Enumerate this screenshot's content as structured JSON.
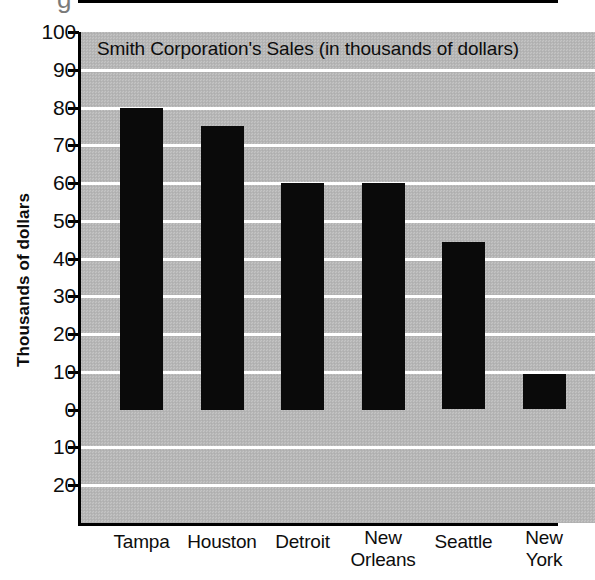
{
  "chart_data": {
    "type": "bar",
    "title": "Smith Corporation's Sales (in thousands of dollars)",
    "xlabel": "",
    "ylabel": "Thousands of dollars",
    "categories": [
      "Tampa",
      "Houston",
      "Detroit",
      "New Orleans",
      "Seattle",
      "New York"
    ],
    "values": [
      80,
      75,
      60,
      60,
      44.5,
      9.5
    ],
    "ylim": [
      -30,
      100
    ],
    "ytick_values": [
      100,
      90,
      80,
      70,
      60,
      50,
      40,
      30,
      20,
      10,
      0,
      -10,
      -20
    ],
    "ytick_labels": [
      "100",
      "90",
      "80",
      "70",
      "60",
      "50",
      "40",
      "30",
      "20",
      "10",
      "0",
      "10",
      "20"
    ],
    "grid": true,
    "legend": false,
    "bar_color": "#0a0a0a",
    "plot_background": "#b9b9b9",
    "gridline_color": "#ffffff",
    "axis_color": "#000000"
  },
  "axis": {
    "y_title": "Thousands of dollars"
  },
  "category_labels": [
    {
      "line1": "Tampa",
      "line2": ""
    },
    {
      "line1": "Houston",
      "line2": ""
    },
    {
      "line1": "Detroit",
      "line2": ""
    },
    {
      "line1": "New",
      "line2": "Orleans"
    },
    {
      "line1": "Seattle",
      "line2": ""
    },
    {
      "line1": "New",
      "line2": "York"
    }
  ],
  "artifacts": {
    "top_cropped_glyph": "g"
  }
}
